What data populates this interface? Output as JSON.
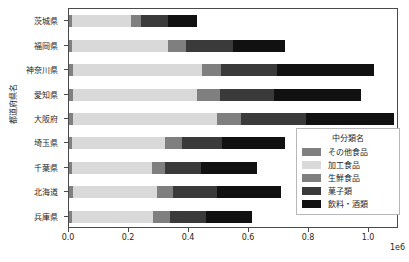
{
  "chart_data": {
    "type": "bar",
    "orientation": "horizontal",
    "stacked": true,
    "title": "",
    "xlabel": "",
    "ylabel": "都道府県名",
    "offset_text": "1e6",
    "xlim": [
      0,
      1100000
    ],
    "xticks": [
      0,
      200000,
      400000,
      600000,
      800000,
      1000000
    ],
    "xticklabels": [
      "0.0",
      "0.2",
      "0.4",
      "0.6",
      "0.8",
      "1.0"
    ],
    "grid": false,
    "legend_position": "center right",
    "legend_title": "中分類名",
    "categories": [
      "茨城県",
      "福岡県",
      "神奈川県",
      "愛知県",
      "大阪府",
      "埼玉県",
      "千葉県",
      "北海道",
      "兵庫県"
    ],
    "series": [
      {
        "name": "その他食品",
        "color": "#808080",
        "values": [
          11000,
          10000,
          13000,
          13000,
          14000,
          11000,
          10000,
          13000,
          11000
        ]
      },
      {
        "name": "加工食品",
        "color": "#d9d9d9",
        "values": [
          195000,
          320000,
          430000,
          415000,
          480000,
          310000,
          265000,
          280000,
          270000
        ]
      },
      {
        "name": "生鮮食品",
        "color": "#7f7f7f",
        "values": [
          35000,
          60000,
          65000,
          75000,
          80000,
          55000,
          45000,
          55000,
          55000
        ]
      },
      {
        "name": "菓子類",
        "color": "#3a3a3a",
        "values": [
          90000,
          155000,
          185000,
          180000,
          215000,
          135000,
          120000,
          145000,
          120000
        ]
      },
      {
        "name": "飲料・酒類",
        "color": "#111111",
        "values": [
          95000,
          175000,
          325000,
          290000,
          295000,
          210000,
          185000,
          215000,
          155000
        ]
      }
    ],
    "totals": [
      426000,
      720000,
      1018000,
      973000,
      1084000,
      721000,
      625000,
      708000,
      611000
    ]
  },
  "axes": {
    "y_title": "都道府県名"
  }
}
